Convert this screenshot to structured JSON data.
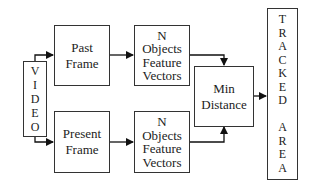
{
  "diagram": {
    "video": {
      "letters": [
        "V",
        "I",
        "D",
        "E",
        "O"
      ]
    },
    "past_frame": {
      "line1": "Past",
      "line2": "Frame"
    },
    "present_frame": {
      "line1": "Present",
      "line2": "Frame"
    },
    "top_features": {
      "line1": "N",
      "line2": "Objects",
      "line3": "Feature",
      "line4": "Vectors"
    },
    "bottom_features": {
      "line1": "N",
      "line2": "Objects",
      "line3": "Feature",
      "line4": "Vectors"
    },
    "min_distance": {
      "line1": "Min",
      "line2": "Distance"
    },
    "tracked_area": {
      "letters": [
        "T",
        "R",
        "A",
        "C",
        "K",
        "E",
        "D",
        "",
        "A",
        "R",
        "E",
        "A"
      ]
    }
  }
}
